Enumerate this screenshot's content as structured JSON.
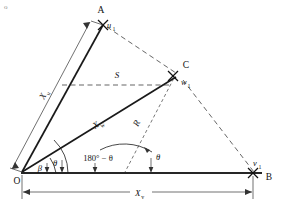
{
  "figure": {
    "type": "geometry-vector-diagram",
    "background_color": "#ffffff",
    "line_color": "#1a1a1a",
    "dash_color": "#4a4a4a",
    "corner_mark": "o"
  },
  "vertices": {
    "origin": {
      "label": "O",
      "x": 21,
      "y": 173
    },
    "apex": {
      "label": "A",
      "x": 101,
      "y": 15
    },
    "middle": {
      "label": "C",
      "x": 180,
      "y": 70
    },
    "right": {
      "label": "B",
      "x": 268,
      "y": 177
    }
  },
  "point_markers": [
    {
      "name": "u1",
      "base": "u",
      "sub": "1",
      "x": 105,
      "y": 31
    },
    {
      "name": "w1",
      "base": "w",
      "sub": "1",
      "x": 182,
      "y": 84
    },
    {
      "name": "v1",
      "base": "v",
      "sub": "1",
      "x": 256,
      "y": 166
    }
  ],
  "dimension_labels": {
    "x_u": {
      "base": "X",
      "sub": "u",
      "x": 48,
      "y": 97,
      "rotation": -63
    },
    "x_w": {
      "base": "X",
      "sub": "w",
      "x": 99,
      "y": 126,
      "rotation": -33
    },
    "x_v": {
      "base": "X",
      "sub": "v",
      "x": 140,
      "y": 196
    },
    "s": {
      "base": "S",
      "x": 119,
      "y": 74
    },
    "r": {
      "base": "R",
      "x": 140,
      "y": 124,
      "rotation": -70
    }
  },
  "angles": [
    {
      "name": "beta",
      "glyph": "β",
      "x": 40,
      "y": 170,
      "description": "angle between baseline and OC"
    },
    {
      "name": "theta-origin",
      "glyph": "θ",
      "x": 54,
      "y": 165,
      "description": "angle between baseline and OA"
    },
    {
      "name": "theta-supplement",
      "text": "180° − θ",
      "x": 96,
      "y": 159,
      "description": "supplement angle at interior"
    },
    {
      "name": "theta-right",
      "glyph": "θ",
      "x": 157,
      "y": 159,
      "description": "angle at C between dashed drop and baseline"
    }
  ],
  "edges": [
    {
      "name": "O-A",
      "style": "solid-heavy",
      "from": "origin",
      "to": "apex"
    },
    {
      "name": "O-C",
      "style": "solid-heavy",
      "from": "origin",
      "to": "middle"
    },
    {
      "name": "O-B",
      "style": "solid-baseline",
      "from": "origin",
      "to": "right"
    },
    {
      "name": "A-C",
      "style": "dashed",
      "from": "apex",
      "to": "middle"
    },
    {
      "name": "C-B",
      "style": "dashed",
      "from": "middle",
      "to": "right"
    },
    {
      "name": "S-line",
      "style": "dashed",
      "from": "OA-midpoint",
      "to": "middle"
    },
    {
      "name": "R-line",
      "style": "dashed-fine",
      "from": "baseline",
      "to": "middle"
    }
  ]
}
